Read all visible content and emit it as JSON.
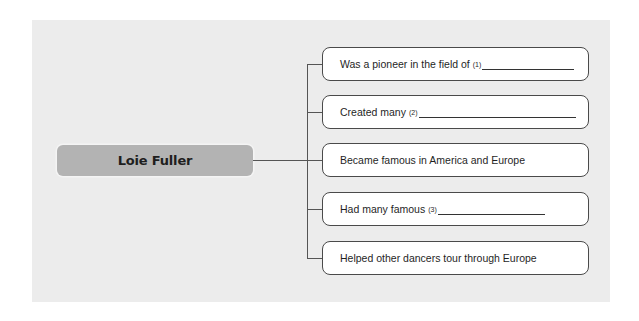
{
  "diagram": {
    "center_node": {
      "label": "Loie Fuller"
    },
    "branches": [
      {
        "text": "Was a pioneer in the field of",
        "blank_number": "(1)",
        "has_blank": true
      },
      {
        "text": "Created many",
        "blank_number": "(2)",
        "has_blank": true
      },
      {
        "text": "Became famous in America and Europe",
        "blank_number": null,
        "has_blank": false
      },
      {
        "text": "Had many famous",
        "blank_number": "(3)",
        "has_blank": true
      },
      {
        "text": "Helped other dancers tour through Europe",
        "blank_number": null,
        "has_blank": false
      }
    ]
  }
}
